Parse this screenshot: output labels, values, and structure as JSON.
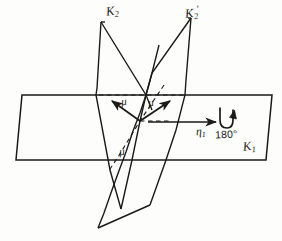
{
  "figure": {
    "type": "line-diagram",
    "background_color": "#fdfdfb",
    "line_color": "#1a1a1a"
  },
  "labels": {
    "k2": {
      "base": "K",
      "sub": "2",
      "prime": ""
    },
    "k2_prime": {
      "base": "K",
      "sub": "2",
      "prime": "'"
    },
    "k1": {
      "base": "K",
      "sub": "1",
      "prime": ""
    },
    "eta1": {
      "base": "η",
      "sub": "1",
      "prime": ""
    },
    "mu_left": "μ",
    "mu_right": "μ",
    "mu_lower": "μ",
    "rotation": "180°"
  },
  "elements": {
    "slab_name": "k1-slab",
    "plane_left_name": "k2-plane",
    "plane_right_name": "k2-prime-plane",
    "arrow_mu_left": "mu-left-arrow",
    "arrow_mu_right": "mu-right-arrow",
    "arrow_eta1": "eta1-arrow",
    "rotation_symbol": "rotation-180-arrow",
    "dashed_top": "dashed-top-trace",
    "dashed_diagonal": "dashed-diagonal-trace",
    "dashed_mid": "dashed-mid-trace"
  }
}
